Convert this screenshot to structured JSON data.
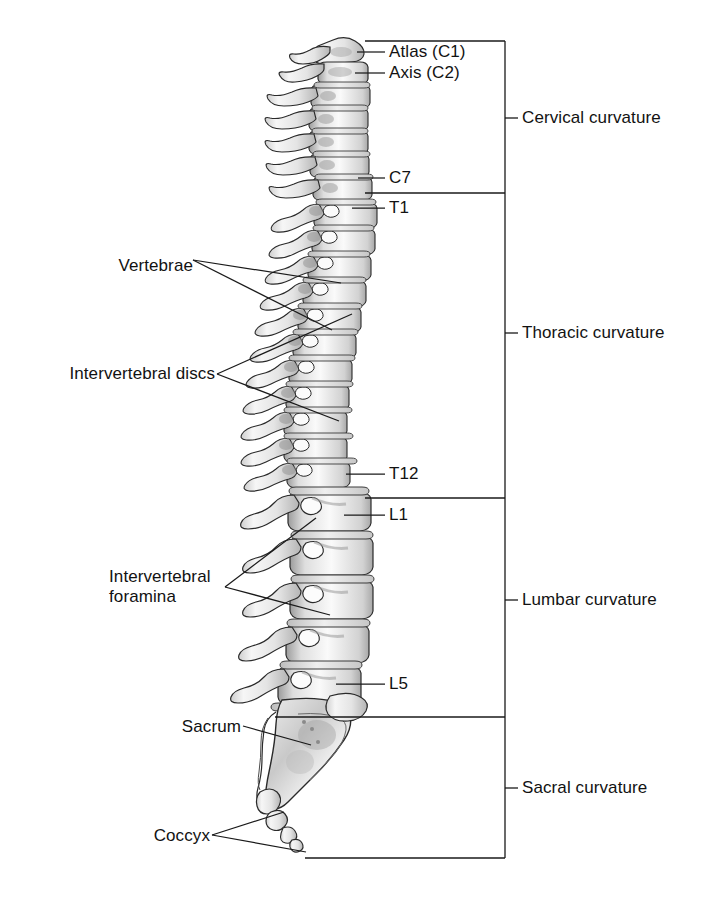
{
  "figure": {
    "background_color": "#ffffff",
    "line_color": "#1a1a1a",
    "bone_fill": "#f2f2f2",
    "bone_shade": "#b9b9b9",
    "bone_shade_dark": "#8a8a8a"
  },
  "vertebra_labels": [
    {
      "id": "atlas",
      "text": "Atlas (C1)",
      "x": 389,
      "y": 46
    },
    {
      "id": "axis",
      "text": "Axis (C2)",
      "x": 389,
      "y": 67
    },
    {
      "id": "c7",
      "text": "C7",
      "x": 389,
      "y": 168
    },
    {
      "id": "t1",
      "text": "T1",
      "x": 389,
      "y": 198
    },
    {
      "id": "t12",
      "text": "T12",
      "x": 389,
      "y": 464
    },
    {
      "id": "l1",
      "text": "L1",
      "x": 389,
      "y": 505
    },
    {
      "id": "l5",
      "text": "L5",
      "x": 389,
      "y": 674
    }
  ],
  "structure_labels": [
    {
      "id": "vertebrae",
      "text": "Vertebrae",
      "x": 110,
      "y": 265,
      "lines": 1
    },
    {
      "id": "intervertebral-discs",
      "text": "Intervertebral discs",
      "x": 22,
      "y": 373,
      "lines": 1
    },
    {
      "id": "intervertebral-foramina",
      "text": "Intervertebral\nforamina",
      "x": 109,
      "y": 557,
      "lines": 2
    },
    {
      "id": "sacrum",
      "text": "Sacrum",
      "x": 183,
      "y": 722,
      "lines": 1
    },
    {
      "id": "coccyx",
      "text": "Coccyx",
      "x": 142,
      "y": 828,
      "lines": 1
    }
  ],
  "curvature_labels": [
    {
      "id": "cervical",
      "text": "Cervical curvature",
      "x": 522,
      "y": 110,
      "tick_y": 118
    },
    {
      "id": "thoracic",
      "text": "Thoracic curvature",
      "x": 522,
      "y": 325,
      "tick_y": 333
    },
    {
      "id": "lumbar",
      "text": "Lumbar curvature",
      "x": 522,
      "y": 592,
      "tick_y": 600
    },
    {
      "id": "sacral",
      "text": "Sacral curvature",
      "x": 522,
      "y": 780,
      "tick_y": 788
    }
  ],
  "bracket": {
    "spine_x": 505,
    "top_y": 41,
    "bottom_y": 858,
    "dividers": [
      {
        "id": "cervical-thoracic",
        "y": 193,
        "x_start": 365
      },
      {
        "id": "thoracic-lumbar",
        "y": 498,
        "x_start": 365
      },
      {
        "id": "lumbar-sacral",
        "y": 717,
        "x_start": 275
      }
    ],
    "top_x_start": 365,
    "bottom_x_start": 305
  }
}
